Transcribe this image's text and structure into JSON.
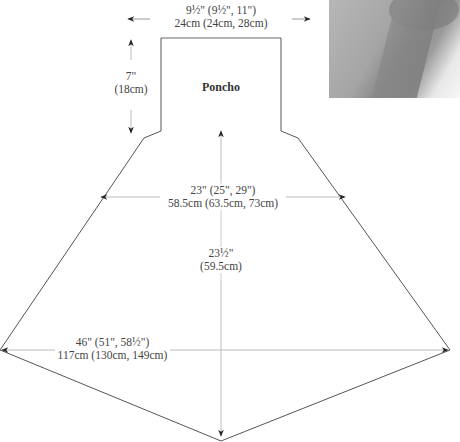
{
  "diagram": {
    "piece_name": "Poncho",
    "measurements": {
      "neck_width": {
        "imperial": "9½\" (9½\", 11\")",
        "metric": "24cm (24cm, 28cm)"
      },
      "neck_height": {
        "imperial": "7\"",
        "metric": "(18cm)"
      },
      "upper_width": {
        "imperial": "23\" (25\", 29\")",
        "metric": "58.5cm (63.5cm, 73cm)"
      },
      "length": {
        "imperial": "23½\"",
        "metric": "(59.5cm)"
      },
      "lower_width": {
        "imperial": "46\" (51\", 58½\")",
        "metric": "117cm (130cm, 149cm)"
      }
    },
    "colors": {
      "outline": "#555555",
      "arrow": "#222222",
      "dimension_line": "#bbbbbb"
    }
  }
}
